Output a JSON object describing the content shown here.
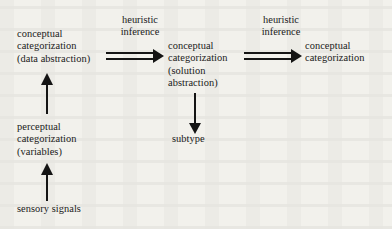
{
  "figure": {
    "type": "flow-diagram",
    "background_color": "#f2f1ec",
    "ink_color": "#141414",
    "nodes": [
      {
        "id": "conceptual-categorization-data",
        "lines": [
          "conceptual",
          "categorization",
          "(data abstraction)"
        ]
      },
      {
        "id": "conceptual-categorization-solution",
        "lines": [
          "conceptual",
          "categorization",
          "(solution",
          "abstraction)"
        ]
      },
      {
        "id": "conceptual-categorization-final",
        "lines": [
          "conceptual",
          "categorization"
        ]
      },
      {
        "id": "perceptual-categorization",
        "lines": [
          "perceptual",
          "categorization",
          "(variables)"
        ]
      },
      {
        "id": "sensory-signals",
        "lines": [
          "sensory signals"
        ]
      },
      {
        "id": "subtype",
        "lines": [
          "subtype"
        ]
      }
    ],
    "edge_labels": [
      {
        "id": "heuristic-inference-1",
        "lines": [
          "heuristic",
          "inference"
        ]
      },
      {
        "id": "heuristic-inference-2",
        "lines": [
          "heuristic",
          "inference"
        ]
      }
    ],
    "edges": [
      {
        "id": "edge-data-to-solution",
        "style": "double-line-arrow",
        "direction": "right",
        "from": "conceptual-categorization-data",
        "to": "conceptual-categorization-solution",
        "label": "heuristic-inference-1"
      },
      {
        "id": "edge-solution-to-final",
        "style": "double-line-arrow",
        "direction": "right",
        "from": "conceptual-categorization-solution",
        "to": "conceptual-categorization-final",
        "label": "heuristic-inference-2"
      },
      {
        "id": "edge-perceptual-to-data",
        "style": "single-line-arrow",
        "direction": "up",
        "from": "perceptual-categorization",
        "to": "conceptual-categorization-data"
      },
      {
        "id": "edge-sensory-to-perceptual",
        "style": "single-line-arrow",
        "direction": "up",
        "from": "sensory-signals",
        "to": "perceptual-categorization"
      },
      {
        "id": "edge-solution-to-subtype",
        "style": "single-line-arrow",
        "direction": "down",
        "from": "conceptual-categorization-solution",
        "to": "subtype"
      }
    ]
  }
}
